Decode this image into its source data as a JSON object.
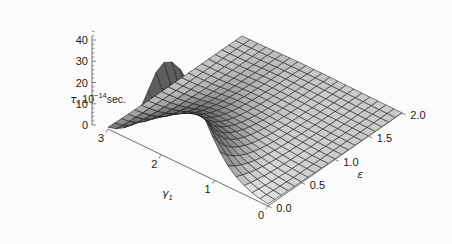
{
  "figure": {
    "background_color": "#fbfbfb",
    "mesh_color": "#1a1a1a",
    "axis_color": "#707070",
    "surface_light": "#f2f2f2",
    "surface_dark": "#4a4a4a"
  },
  "axes": {
    "z": {
      "name": "tau-axis",
      "label_prefix": "τ, 10",
      "label_exponent": "−14",
      "label_suffix": "sec.",
      "full_label": "τ, 10−14sec.",
      "ticks": [
        "0",
        "10",
        "20",
        "30",
        "40"
      ],
      "values": [
        0,
        10,
        20,
        30,
        40
      ],
      "min": 0,
      "max": 46
    },
    "x": {
      "name": "gamma1-axis",
      "label": "γ",
      "label_subscript": "1",
      "full_label": "γ₁",
      "ticks": [
        "3",
        "2",
        "1",
        "0"
      ],
      "values": [
        3,
        2,
        1,
        0
      ],
      "min": 0,
      "max": 3
    },
    "y": {
      "name": "epsilon-axis",
      "label": "ε",
      "full_label": "ε",
      "ticks": [
        "0.0",
        "0.5",
        "1.0",
        "1.5",
        "2.0"
      ],
      "values": [
        0.0,
        0.5,
        1.0,
        1.5,
        2.0
      ],
      "min": 0.0,
      "max": 2.0
    }
  },
  "chart_data": {
    "type": "surface",
    "title": "",
    "xlabel": "γ₁",
    "ylabel": "ε",
    "zlabel": "τ, 10−14sec.",
    "xlim": [
      0,
      3
    ],
    "ylim": [
      0,
      2
    ],
    "zlim": [
      0,
      46
    ],
    "grid": true,
    "legend": "none",
    "projection": "3d-mathematica-plot3d",
    "mesh_nx": 21,
    "mesh_ny": 21,
    "shading": "grayscale",
    "peak": {
      "x": 2.1,
      "y": 0.0,
      "z": 46
    },
    "x": [
      0,
      0.15,
      0.3,
      0.45,
      0.6,
      0.75,
      0.9,
      1.05,
      1.2,
      1.35,
      1.5,
      1.65,
      1.8,
      1.95,
      2.1,
      2.25,
      2.4,
      2.55,
      2.7,
      2.85,
      3
    ],
    "y": [
      0,
      0.1,
      0.2,
      0.3,
      0.4,
      0.5,
      0.6,
      0.7,
      0.8,
      0.9,
      1.0,
      1.1,
      1.2,
      1.3,
      1.4,
      1.5,
      1.6,
      1.7,
      1.8,
      1.9,
      2.0
    ],
    "z_rows": [
      [
        1.0,
        0.9,
        0.8,
        0.7,
        0.6,
        0.5,
        0.45,
        0.4,
        0.35,
        0.3,
        0.27,
        0.24,
        0.21,
        0.19,
        0.17,
        0.15,
        0.13,
        0.12,
        0.11,
        0.1,
        0.09
      ],
      [
        1.6,
        1.4,
        1.2,
        1.0,
        0.85,
        0.72,
        0.62,
        0.54,
        0.47,
        0.41,
        0.36,
        0.32,
        0.28,
        0.25,
        0.22,
        0.2,
        0.18,
        0.16,
        0.14,
        0.13,
        0.12
      ],
      [
        2.6,
        2.2,
        1.8,
        1.5,
        1.25,
        1.05,
        0.88,
        0.75,
        0.64,
        0.55,
        0.48,
        0.42,
        0.37,
        0.33,
        0.29,
        0.26,
        0.23,
        0.21,
        0.19,
        0.17,
        0.15
      ],
      [
        4.2,
        3.4,
        2.8,
        2.2,
        1.8,
        1.5,
        1.24,
        1.04,
        0.88,
        0.75,
        0.64,
        0.56,
        0.49,
        0.43,
        0.38,
        0.34,
        0.3,
        0.27,
        0.24,
        0.22,
        0.2
      ],
      [
        6.5,
        5.2,
        4.1,
        3.3,
        2.6,
        2.1,
        1.72,
        1.42,
        1.18,
        1.0,
        0.85,
        0.73,
        0.63,
        0.55,
        0.48,
        0.43,
        0.38,
        0.34,
        0.3,
        0.27,
        0.25
      ],
      [
        9.8,
        7.6,
        5.9,
        4.6,
        3.6,
        2.85,
        2.3,
        1.87,
        1.53,
        1.28,
        1.08,
        0.92,
        0.79,
        0.68,
        0.6,
        0.52,
        0.46,
        0.41,
        0.37,
        0.33,
        0.3
      ],
      [
        14.5,
        11.0,
        8.3,
        6.3,
        4.9,
        3.8,
        3.0,
        2.4,
        1.95,
        1.6,
        1.34,
        1.13,
        0.96,
        0.83,
        0.72,
        0.63,
        0.55,
        0.49,
        0.44,
        0.39,
        0.35
      ],
      [
        20.5,
        15.2,
        11.2,
        8.4,
        6.4,
        4.9,
        3.85,
        3.05,
        2.45,
        2.0,
        1.65,
        1.38,
        1.17,
        1.0,
        0.86,
        0.75,
        0.66,
        0.58,
        0.52,
        0.46,
        0.41
      ],
      [
        27.5,
        20.0,
        14.5,
        10.7,
        8.0,
        6.1,
        4.75,
        3.72,
        2.97,
        2.4,
        1.97,
        1.63,
        1.37,
        1.17,
        1.0,
        0.87,
        0.76,
        0.67,
        0.59,
        0.53,
        0.47
      ],
      [
        34.5,
        24.8,
        17.6,
        12.8,
        9.5,
        7.2,
        5.55,
        4.32,
        3.42,
        2.75,
        2.24,
        1.85,
        1.54,
        1.31,
        1.12,
        0.96,
        0.84,
        0.74,
        0.65,
        0.58,
        0.52
      ],
      [
        40.5,
        29.0,
        20.4,
        14.7,
        10.8,
        8.1,
        6.2,
        4.8,
        3.78,
        3.02,
        2.45,
        2.01,
        1.67,
        1.41,
        1.2,
        1.03,
        0.9,
        0.78,
        0.69,
        0.61,
        0.55
      ],
      [
        44.5,
        32.0,
        22.4,
        16.0,
        11.7,
        8.75,
        6.65,
        5.15,
        4.03,
        3.21,
        2.6,
        2.13,
        1.76,
        1.48,
        1.26,
        1.08,
        0.94,
        0.82,
        0.72,
        0.64,
        0.57
      ],
      [
        46.0,
        33.2,
        23.2,
        16.6,
        12.1,
        9.0,
        6.85,
        5.28,
        4.13,
        3.29,
        2.66,
        2.17,
        1.8,
        1.51,
        1.28,
        1.1,
        0.95,
        0.83,
        0.73,
        0.65,
        0.58
      ],
      [
        44.0,
        31.6,
        22.1,
        15.8,
        11.5,
        8.6,
        6.5,
        5.02,
        3.93,
        3.13,
        2.53,
        2.07,
        1.71,
        1.44,
        1.22,
        1.05,
        0.91,
        0.8,
        0.7,
        0.62,
        0.56
      ],
      [
        37.5,
        26.8,
        18.7,
        13.4,
        9.8,
        7.3,
        5.55,
        4.3,
        3.37,
        2.69,
        2.18,
        1.79,
        1.48,
        1.25,
        1.06,
        0.91,
        0.79,
        0.7,
        0.61,
        0.55,
        0.49
      ],
      [
        27.0,
        19.3,
        13.6,
        9.8,
        7.2,
        5.4,
        4.12,
        3.2,
        2.52,
        2.02,
        1.64,
        1.35,
        1.12,
        0.95,
        0.81,
        0.7,
        0.61,
        0.54,
        0.48,
        0.43,
        0.38
      ],
      [
        16.5,
        11.9,
        8.5,
        6.2,
        4.6,
        3.48,
        2.68,
        2.1,
        1.67,
        1.34,
        1.1,
        0.91,
        0.76,
        0.64,
        0.55,
        0.48,
        0.42,
        0.37,
        0.33,
        0.3,
        0.27
      ],
      [
        8.8,
        6.4,
        4.7,
        3.5,
        2.65,
        2.02,
        1.58,
        1.25,
        1.0,
        0.81,
        0.67,
        0.56,
        0.47,
        0.4,
        0.35,
        0.3,
        0.27,
        0.24,
        0.21,
        0.19,
        0.17
      ],
      [
        4.2,
        3.1,
        2.35,
        1.78,
        1.38,
        1.07,
        0.85,
        0.68,
        0.55,
        0.45,
        0.38,
        0.32,
        0.27,
        0.23,
        0.2,
        0.18,
        0.16,
        0.14,
        0.13,
        0.12,
        0.11
      ],
      [
        1.9,
        1.45,
        1.12,
        0.87,
        0.69,
        0.55,
        0.44,
        0.36,
        0.3,
        0.25,
        0.21,
        0.18,
        0.16,
        0.14,
        0.12,
        0.11,
        0.1,
        0.09,
        0.08,
        0.07,
        0.07
      ],
      [
        0.85,
        0.66,
        0.52,
        0.42,
        0.34,
        0.27,
        0.22,
        0.19,
        0.16,
        0.13,
        0.12,
        0.1,
        0.09,
        0.08,
        0.07,
        0.06,
        0.06,
        0.05,
        0.05,
        0.04,
        0.04
      ]
    ]
  }
}
